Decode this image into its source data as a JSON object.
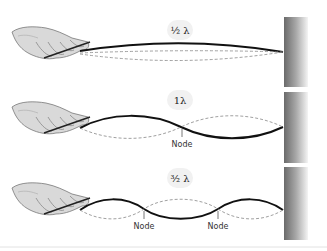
{
  "diagram": {
    "panels": [
      {
        "label": "½ λ",
        "harmonic": "1/2",
        "nodes": []
      },
      {
        "label": "1λ",
        "harmonic": "1",
        "nodes": [
          "Node"
        ]
      },
      {
        "label": "³⁄₂ λ",
        "harmonic": "3/2",
        "nodes": [
          "Node",
          "Node"
        ]
      }
    ],
    "colors": {
      "string": "#111111",
      "dashed": "#888888",
      "wall_dark": "#6e6e6e",
      "wall_light": "#f0f0f0",
      "label_bg": "#f1f1f1"
    }
  }
}
